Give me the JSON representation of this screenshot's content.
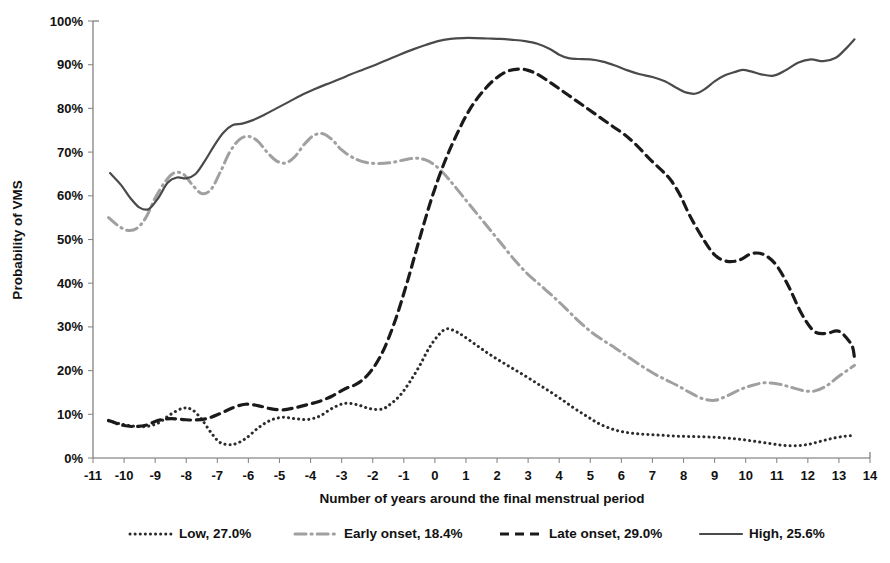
{
  "chart_data": {
    "type": "line",
    "title": "",
    "xlabel": "Number of years around the final menstrual period",
    "ylabel": "Probability of VMS",
    "xlim": [
      -11,
      14
    ],
    "ylim": [
      0,
      1
    ],
    "grid": false,
    "legend_position": "bottom",
    "x_ticks": [
      "-11",
      "-10",
      "-9",
      "-8",
      "-7",
      "-6",
      "-5",
      "-4",
      "-3",
      "-2",
      "-1",
      "0",
      "1",
      "2",
      "3",
      "4",
      "5",
      "6",
      "7",
      "8",
      "9",
      "10",
      "11",
      "12",
      "13",
      "14"
    ],
    "x_tick_values": [
      -11,
      -10,
      -9,
      -8,
      -7,
      -6,
      -5,
      -4,
      -3,
      -2,
      -1,
      0,
      1,
      2,
      3,
      4,
      5,
      6,
      7,
      8,
      9,
      10,
      11,
      12,
      13,
      14
    ],
    "y_ticks": [
      "0%",
      "10%",
      "20%",
      "30%",
      "40%",
      "50%",
      "60%",
      "70%",
      "80%",
      "90%",
      "100%"
    ],
    "y_tick_values": [
      0,
      10,
      20,
      30,
      40,
      50,
      60,
      70,
      80,
      90,
      100
    ],
    "series": [
      {
        "name": "Low, 27.0%",
        "label": "Low",
        "percent": "27.0%",
        "style": "dotted",
        "color": "#2b2b2b",
        "x": [
          -10.5,
          -10.1,
          -9.7,
          -9.3,
          -8.9,
          -8.5,
          -8.1,
          -7.8,
          -7.5,
          -7.2,
          -6.9,
          -6.5,
          -6.1,
          -5.7,
          -5.3,
          -4.9,
          -4.5,
          -4.1,
          -3.7,
          -3.3,
          -2.9,
          -2.5,
          -2.1,
          -1.7,
          -1.4,
          -1.1,
          -0.8,
          -0.5,
          -0.2,
          0.1,
          0.35,
          0.6,
          0.9,
          1.3,
          1.7,
          2.1,
          2.5,
          2.9,
          3.3,
          3.7,
          4.1,
          4.5,
          4.9,
          5.3,
          5.8,
          6.3,
          6.8,
          7.3,
          7.8,
          8.3,
          8.8,
          9.3,
          9.8,
          10.3,
          10.8,
          11.2,
          11.6,
          12.0,
          12.4,
          12.8,
          13.2,
          13.5
        ],
        "y": [
          8.5,
          7.8,
          7.3,
          7.2,
          8.0,
          10.0,
          11.4,
          11.0,
          8.8,
          5.8,
          3.5,
          3.1,
          4.4,
          6.8,
          8.6,
          9.3,
          9.0,
          8.8,
          9.6,
          11.4,
          12.5,
          12.2,
          11.3,
          11.2,
          12.5,
          14.5,
          17.5,
          21.0,
          25.0,
          28.0,
          29.5,
          29.2,
          28.0,
          26.0,
          24.0,
          22.2,
          20.5,
          18.8,
          17.0,
          15.2,
          13.3,
          11.3,
          9.5,
          7.8,
          6.4,
          5.7,
          5.4,
          5.2,
          5.0,
          4.9,
          4.8,
          4.6,
          4.3,
          3.8,
          3.3,
          2.9,
          2.8,
          3.1,
          3.8,
          4.5,
          5.0,
          5.1
        ]
      },
      {
        "name": "Early onset, 18.4%",
        "label": "Early onset",
        "percent": "18.4%",
        "style": "dashdot",
        "color": "#a0a0a0",
        "x": [
          -10.5,
          -10.2,
          -9.9,
          -9.6,
          -9.3,
          -9.0,
          -8.7,
          -8.4,
          -8.1,
          -7.8,
          -7.5,
          -7.2,
          -6.9,
          -6.6,
          -6.3,
          -6.0,
          -5.7,
          -5.4,
          -5.1,
          -4.8,
          -4.5,
          -4.2,
          -3.9,
          -3.6,
          -3.3,
          -3.0,
          -2.6,
          -2.2,
          -1.8,
          -1.4,
          -1.0,
          -0.6,
          -0.3,
          0.0,
          0.3,
          0.6,
          1.0,
          1.4,
          1.8,
          2.2,
          2.6,
          3.0,
          3.4,
          3.8,
          4.2,
          4.6,
          5.0,
          5.4,
          5.8,
          6.2,
          6.6,
          7.0,
          7.4,
          7.8,
          8.2,
          8.6,
          9.0,
          9.4,
          9.8,
          10.2,
          10.6,
          11.0,
          11.4,
          11.8,
          12.2,
          12.6,
          13.0,
          13.4,
          13.5
        ],
        "y": [
          55.0,
          53.2,
          52.1,
          52.5,
          55.0,
          59.5,
          63.0,
          65.2,
          65.0,
          62.5,
          60.5,
          61.5,
          65.5,
          70.0,
          72.8,
          73.6,
          72.5,
          70.0,
          68.0,
          67.5,
          69.0,
          71.8,
          73.8,
          74.2,
          72.8,
          70.5,
          68.6,
          67.6,
          67.4,
          67.6,
          68.2,
          68.6,
          68.2,
          67.0,
          65.0,
          62.5,
          59.0,
          55.5,
          52.0,
          48.5,
          45.0,
          42.0,
          39.5,
          37.0,
          34.3,
          31.5,
          29.0,
          27.0,
          25.2,
          23.2,
          21.3,
          19.5,
          18.0,
          16.6,
          15.0,
          13.6,
          13.2,
          14.2,
          15.6,
          16.6,
          17.2,
          17.0,
          16.3,
          15.5,
          15.3,
          16.5,
          18.7,
          20.7,
          21.2
        ]
      },
      {
        "name": "Late onset, 29.0%",
        "label": "Late onset",
        "percent": "29.0%",
        "style": "dashed",
        "color": "#1a1a1a",
        "x": [
          -10.5,
          -10.1,
          -9.7,
          -9.3,
          -8.9,
          -8.5,
          -8.1,
          -7.7,
          -7.3,
          -6.9,
          -6.5,
          -6.1,
          -5.7,
          -5.3,
          -4.9,
          -4.5,
          -4.1,
          -3.7,
          -3.3,
          -2.9,
          -2.5,
          -2.1,
          -1.7,
          -1.3,
          -0.9,
          -0.5,
          -0.1,
          0.3,
          0.7,
          1.1,
          1.5,
          1.9,
          2.3,
          2.7,
          3.0,
          3.3,
          3.7,
          4.1,
          4.5,
          4.9,
          5.3,
          5.7,
          6.1,
          6.5,
          6.9,
          7.3,
          7.6,
          7.9,
          8.2,
          8.6,
          9.0,
          9.4,
          9.8,
          10.2,
          10.6,
          11.0,
          11.4,
          11.8,
          12.2,
          12.6,
          13.0,
          13.4,
          13.5
        ],
        "y": [
          8.6,
          7.6,
          7.2,
          7.5,
          8.6,
          9.0,
          8.8,
          8.7,
          9.1,
          10.2,
          11.5,
          12.3,
          12.0,
          11.3,
          11.0,
          11.5,
          12.2,
          13.0,
          14.2,
          15.8,
          17.0,
          19.5,
          24.0,
          31.0,
          40.0,
          50.0,
          59.5,
          67.5,
          74.0,
          79.5,
          83.5,
          86.5,
          88.4,
          89.0,
          88.7,
          87.8,
          86.0,
          84.0,
          82.0,
          80.0,
          78.0,
          76.0,
          74.0,
          71.5,
          68.5,
          65.8,
          63.5,
          60.0,
          55.5,
          50.5,
          46.5,
          45.0,
          45.3,
          46.8,
          46.5,
          44.0,
          39.0,
          33.0,
          29.0,
          28.5,
          29.0,
          26.0,
          23.0
        ]
      },
      {
        "name": "High, 25.6%",
        "label": "High",
        "percent": "25.6%",
        "style": "solid",
        "color": "#4a4a4a",
        "x": [
          -10.45,
          -10.1,
          -9.8,
          -9.5,
          -9.2,
          -8.9,
          -8.6,
          -8.3,
          -8.0,
          -7.7,
          -7.4,
          -7.1,
          -6.8,
          -6.5,
          -6.2,
          -5.9,
          -5.5,
          -5.1,
          -4.7,
          -4.3,
          -3.9,
          -3.5,
          -3.1,
          -2.7,
          -2.3,
          -1.9,
          -1.5,
          -1.1,
          -0.7,
          -0.3,
          0.1,
          0.5,
          0.9,
          1.3,
          1.7,
          2.1,
          2.5,
          2.9,
          3.3,
          3.7,
          4.0,
          4.3,
          4.6,
          5.0,
          5.4,
          5.8,
          6.2,
          6.6,
          7.0,
          7.4,
          7.8,
          8.1,
          8.4,
          8.7,
          9.0,
          9.3,
          9.6,
          9.9,
          10.2,
          10.5,
          10.9,
          11.3,
          11.7,
          12.1,
          12.5,
          12.9,
          13.2,
          13.5
        ],
        "y": [
          65.2,
          62.5,
          59.5,
          57.3,
          57.0,
          59.5,
          63.0,
          64.2,
          64.0,
          65.0,
          68.0,
          71.5,
          74.5,
          76.2,
          76.5,
          77.2,
          78.5,
          80.0,
          81.5,
          83.0,
          84.3,
          85.5,
          86.6,
          87.8,
          88.9,
          90.0,
          91.2,
          92.4,
          93.5,
          94.5,
          95.4,
          95.9,
          96.1,
          96.1,
          96.0,
          95.9,
          95.7,
          95.4,
          94.8,
          93.6,
          92.3,
          91.5,
          91.3,
          91.2,
          90.7,
          89.8,
          88.7,
          87.8,
          87.2,
          86.2,
          84.6,
          83.6,
          83.4,
          84.5,
          86.2,
          87.5,
          88.2,
          88.8,
          88.4,
          87.8,
          87.5,
          88.8,
          90.5,
          91.2,
          90.8,
          91.6,
          93.5,
          95.8
        ]
      }
    ]
  },
  "legend": {
    "items": [
      {
        "label": "Low, 27.0%",
        "style": "dotted",
        "color": "#2b2b2b"
      },
      {
        "label": "Early onset, 18.4%",
        "style": "dashdot",
        "color": "#a0a0a0"
      },
      {
        "label": "Late onset, 29.0%",
        "style": "dashed",
        "color": "#1a1a1a"
      },
      {
        "label": "High, 25.6%",
        "style": "solid",
        "color": "#4a4a4a"
      }
    ]
  }
}
